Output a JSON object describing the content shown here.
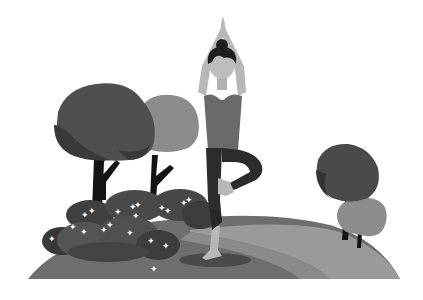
{
  "scene": {
    "description": "Grayscale flat illustration of a woman doing a yoga tree pose on a grassy hill with trees and flowering bushes",
    "colors": {
      "background": "#ffffff",
      "hill_dark": "#6e6e6e",
      "hill_light": "#9a9a9a",
      "path_edge": "#5a5a5a",
      "shadow": "#4a4a4a",
      "tree_dark": "#3d3d3d",
      "tree_mid": "#4f4f4f",
      "tree_light": "#8c8c8c",
      "trunk": "#141414",
      "bush_dark": "#383838",
      "bush_mid": "#555555",
      "flower": "#ffffff",
      "skin": "#b8b8b8",
      "hair": "#1e1e1e",
      "shirt": "#6a6a6a",
      "leggings": "#2c2c2c"
    }
  }
}
